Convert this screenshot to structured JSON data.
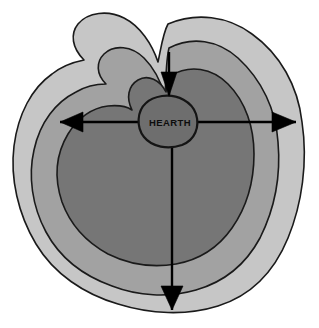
{
  "diagram": {
    "center_label": "HEARTH",
    "background_color": "#ffffff",
    "zones": [
      {
        "name": "outer-zone",
        "label": "outer zone",
        "fill": "#c6c6c6",
        "stroke": "#1a1a1a"
      },
      {
        "name": "middle-zone",
        "label": "middle zone",
        "fill": "#a2a2a2",
        "stroke": "#1a1a1a"
      },
      {
        "name": "inner-zone",
        "label": "inner zone",
        "fill": "#767676",
        "stroke": "#1a1a1a"
      },
      {
        "name": "hearth-core",
        "label": "HEARTH",
        "fill": "#6e6e6e",
        "stroke": "#141414"
      }
    ],
    "arrows": [
      {
        "name": "arrow-left",
        "direction": "left",
        "from_x": 200,
        "from_y": 122,
        "to_x": 60,
        "to_y": 122
      },
      {
        "name": "arrow-right",
        "direction": "right",
        "from_x": 140,
        "from_y": 122,
        "to_x": 296,
        "to_y": 122
      },
      {
        "name": "arrow-down",
        "direction": "down",
        "from_x": 172,
        "from_y": 140,
        "to_x": 172,
        "to_y": 310
      },
      {
        "name": "arrow-up-inward",
        "direction": "down",
        "from_x": 169,
        "from_y": 52,
        "to_x": 169,
        "to_y": 95
      }
    ],
    "geometry": {
      "outer_zone_path": "M 168 24 C 196 12 228 16 252 34 C 280 54 298 86 302 122 C 308 162 302 204 288 238 C 274 272 250 296 218 306 C 186 316 150 314 118 304 C 84 294 54 274 36 244 C 18 214 10 178 14 146 C 18 114 32 88 52 74 C 62 66 74 62 84 60 C 72 48 70 34 78 24 C 88 12 108 10 124 18 C 140 26 152 44 158 62 C 161 48 163 33 168 24 Z",
      "middle_zone_path": "M 169 48 C 192 36 218 40 238 58 C 262 80 276 110 278 142 C 281 176 274 210 260 238 C 246 264 224 282 196 290 C 168 298 138 296 112 286 C 84 276 60 258 46 232 C 32 206 28 176 34 150 C 40 122 56 102 76 92 C 86 86 96 84 106 84 C 96 74 96 62 104 54 C 114 44 132 46 144 58 C 154 68 161 82 165 96 C 166 78 166 60 169 48 Z",
      "inner_zone_path": "M 170 76 C 190 64 212 68 228 84 C 246 102 254 128 254 154 C 254 182 246 208 232 228 C 218 248 198 260 176 264 C 152 268 128 264 108 254 C 86 242 70 224 62 202 C 54 178 56 154 68 134 C 78 118 92 108 108 106 C 118 105 126 106 132 110 C 126 98 128 86 138 80 C 148 74 160 80 166 92 C 167 86 168 80 170 76 Z",
      "hearth_path": "M 162 96 C 178 94 192 102 196 114 C 200 127 195 140 182 145 C 168 150 152 147 144 137 C 136 127 137 111 146 103 C 150 99 156 97 162 96 Z"
    }
  }
}
